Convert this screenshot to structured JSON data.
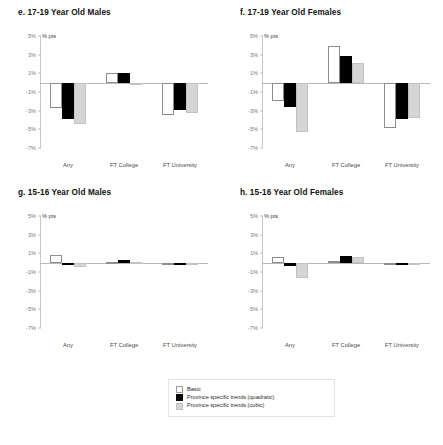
{
  "figure": {
    "unit_label": "% pts",
    "categories": [
      "Any",
      "FT College",
      "FT University"
    ],
    "yticks": [
      "5%",
      "3%",
      "1%",
      "-1%",
      "-3%",
      "-5%",
      "-7%"
    ],
    "ylim": [
      -7,
      5
    ],
    "series_names": [
      "Basic",
      "Province specific trends (quadratic)",
      "Province specific trends (cubic)"
    ]
  },
  "legend": {
    "items": [
      {
        "label": "Basic",
        "swatch": "basic",
        "color": "#ffffff"
      },
      {
        "label": "Province specific trends (quadratic)",
        "swatch": "quad",
        "color": "#000000"
      },
      {
        "label": "Province specific trends (cubic)",
        "swatch": "cubic",
        "color": "#d5d5d5"
      }
    ]
  },
  "chart_data": [
    {
      "type": "bar",
      "panel_id": "e",
      "title": "e. 17-19 Year Old Males",
      "categories": [
        "Any",
        "FT College",
        "FT University"
      ],
      "series": [
        {
          "name": "Basic",
          "values": [
            -2.7,
            1.0,
            -3.5
          ]
        },
        {
          "name": "Province specific trends (quadratic)",
          "values": [
            -3.9,
            1.0,
            -2.9
          ]
        },
        {
          "name": "Province specific trends (cubic)",
          "values": [
            -4.4,
            -0.05,
            -3.2
          ]
        }
      ],
      "xlabel": "",
      "ylabel": "% pts",
      "ylim": [
        -7,
        5
      ],
      "grid": false
    },
    {
      "type": "bar",
      "panel_id": "f",
      "title": "f. 17-19 Year Old Females",
      "categories": [
        "Any",
        "FT College",
        "FT University"
      ],
      "series": [
        {
          "name": "Basic",
          "values": [
            -2.0,
            3.9,
            -4.9
          ]
        },
        {
          "name": "Province specific trends (quadratic)",
          "values": [
            -2.6,
            2.9,
            -3.9
          ]
        },
        {
          "name": "Province specific trends (cubic)",
          "values": [
            -5.3,
            2.1,
            -3.8
          ]
        }
      ],
      "xlabel": "",
      "ylabel": "% pts",
      "ylim": [
        -7,
        5
      ],
      "grid": false
    },
    {
      "type": "bar",
      "panel_id": "g",
      "title": "g. 15-16 Year Old Males",
      "categories": [
        "Any",
        "FT College",
        "FT University"
      ],
      "series": [
        {
          "name": "Basic",
          "values": [
            0.85,
            0.1,
            0.0
          ]
        },
        {
          "name": "Province specific trends (quadratic)",
          "values": [
            0.0,
            0.25,
            0.0
          ]
        },
        {
          "name": "Province specific trends (cubic)",
          "values": [
            -0.5,
            0.05,
            -0.05
          ]
        }
      ],
      "xlabel": "",
      "ylabel": "% pts",
      "ylim": [
        -7,
        5
      ],
      "grid": false
    },
    {
      "type": "bar",
      "panel_id": "h",
      "title": "h. 15-16 Year Old Females",
      "categories": [
        "Any",
        "FT College",
        "FT University"
      ],
      "series": [
        {
          "name": "Basic",
          "values": [
            0.6,
            0.2,
            -0.15
          ]
        },
        {
          "name": "Province specific trends (quadratic)",
          "values": [
            -0.35,
            0.7,
            -0.2
          ]
        },
        {
          "name": "Province specific trends (cubic)",
          "values": [
            -1.6,
            0.65,
            0.0
          ]
        }
      ],
      "xlabel": "",
      "ylabel": "% pts",
      "ylim": [
        -7,
        5
      ],
      "grid": false
    }
  ]
}
